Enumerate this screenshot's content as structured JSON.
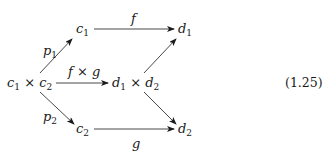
{
  "diagram": {
    "type": "commutative-diagram",
    "equation_number": "(1.25)",
    "nodes": {
      "c1": {
        "base": "c",
        "sub": "1"
      },
      "d1": {
        "base": "d",
        "sub": "1"
      },
      "c1xc2": {
        "a": "c",
        "a_sub": "1",
        "op": " × ",
        "b": "c",
        "b_sub": "2"
      },
      "d1xd2": {
        "a": "d",
        "a_sub": "1",
        "op": " × ",
        "b": "d",
        "b_sub": "2"
      },
      "c2": {
        "base": "c",
        "sub": "2"
      },
      "d2": {
        "base": "d",
        "sub": "2"
      }
    },
    "edges": {
      "f": {
        "label": "f",
        "from": "c1",
        "to": "d1"
      },
      "fxg": {
        "label": "f × g",
        "from": "c1xc2",
        "to": "d1xd2"
      },
      "g": {
        "label": "g",
        "from": "c2",
        "to": "d2"
      },
      "p1": {
        "label": "p",
        "label_sub": "1",
        "from": "c1xc2",
        "to": "c1"
      },
      "p2": {
        "label": "p",
        "label_sub": "2",
        "from": "c1xc2",
        "to": "c2"
      },
      "d1xd2_to_d1": {
        "label": "",
        "from": "d1xd2",
        "to": "d1"
      },
      "d1xd2_to_d2": {
        "label": "",
        "from": "d1xd2",
        "to": "d2"
      }
    },
    "colors": {
      "ink": "#1a1a1a",
      "background": "#ffffff"
    }
  }
}
